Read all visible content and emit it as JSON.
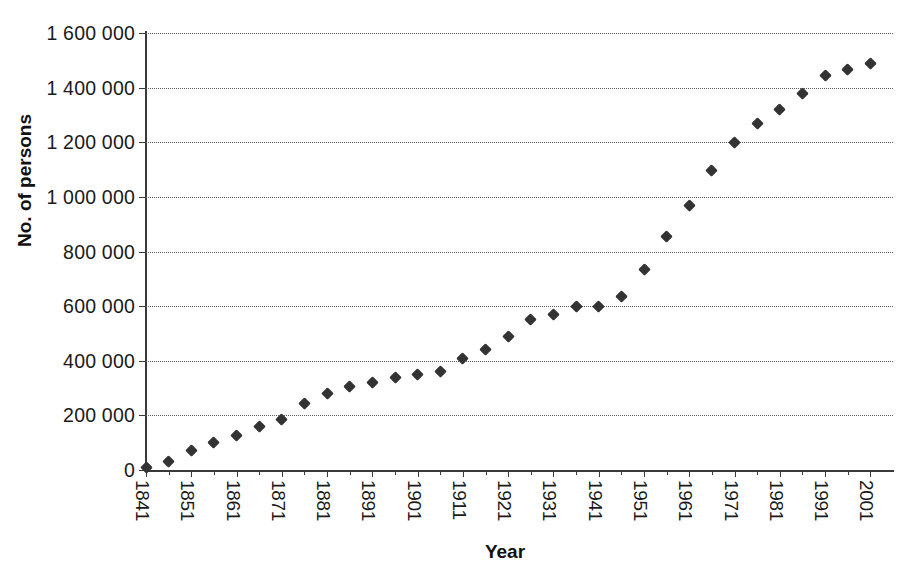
{
  "figure": {
    "title_remnant": "",
    "background": "#ffffff",
    "marker_color": "#333333",
    "grid_color": "#5c5c5c",
    "axis_color": "#3a3a3a"
  },
  "axes": {
    "x_title": "Year",
    "y_title": "No. of persons",
    "y_ticks": [
      "0",
      "200 000",
      "400 000",
      "600 000",
      "800 000",
      "1 000 000",
      "1 200 000",
      "1 400 000",
      "1 600 000"
    ],
    "x_ticks": [
      "1841",
      "1851",
      "1861",
      "1871",
      "1881",
      "1891",
      "1901",
      "1911",
      "1921",
      "1931",
      "1941",
      "1951",
      "1961",
      "1971",
      "1981",
      "1991",
      "2001"
    ]
  },
  "chart_data": {
    "type": "scatter",
    "title": "",
    "xlabel": "Year",
    "ylabel": "No. of persons",
    "xlim": [
      1841,
      2006
    ],
    "ylim": [
      0,
      1600000
    ],
    "ytick_values": [
      0,
      200000,
      400000,
      600000,
      800000,
      1000000,
      1200000,
      1400000,
      1600000
    ],
    "xtick_values": [
      1841,
      1851,
      1861,
      1871,
      1881,
      1891,
      1901,
      1911,
      1921,
      1931,
      1941,
      1951,
      1961,
      1971,
      1981,
      1991,
      2001
    ],
    "grid": "horizontal-dotted",
    "legend": "none",
    "marker": "diamond",
    "series": [
      {
        "name": "No. of persons",
        "x": [
          1841,
          1846,
          1851,
          1856,
          1861,
          1866,
          1871,
          1876,
          1881,
          1886,
          1891,
          1896,
          1901,
          1906,
          1911,
          1916,
          1921,
          1926,
          1931,
          1936,
          1941,
          1946,
          1951,
          1956,
          1961,
          1966,
          1971,
          1976,
          1981,
          1986,
          1991,
          1996,
          2001
        ],
        "y": [
          10000,
          30000,
          70000,
          100000,
          125000,
          160000,
          185000,
          245000,
          280000,
          305000,
          320000,
          340000,
          350000,
          360000,
          410000,
          440000,
          490000,
          550000,
          570000,
          600000,
          600000,
          635000,
          735000,
          855000,
          970000,
          1095000,
          1200000,
          1270000,
          1320000,
          1380000,
          1445000,
          1465000,
          1490000
        ]
      }
    ]
  }
}
